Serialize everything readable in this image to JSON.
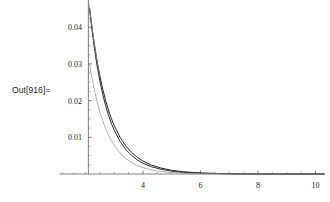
{
  "cell": {
    "out_label": "Out[916]="
  },
  "chart_data": {
    "type": "line",
    "title": "",
    "xlabel": "",
    "ylabel": "",
    "xlim": [
      2.1,
      10.3
    ],
    "ylim": [
      0,
      0.0455
    ],
    "grid": false,
    "legend": null,
    "x_ticks": [
      4,
      6,
      8,
      10
    ],
    "x_tick_labels": [
      "4",
      "6",
      "8",
      "10"
    ],
    "x_minor_ticks": [
      2.5,
      3.0,
      3.5,
      4.5,
      5.0,
      5.5,
      6.5,
      7.0,
      7.5,
      8.5,
      9.0,
      9.5
    ],
    "y_ticks": [
      0.01,
      0.02,
      0.03,
      0.04
    ],
    "y_tick_labels": [
      "0.01",
      "0.02",
      "0.03",
      "0.04"
    ],
    "y_minor_ticks": [
      0.0025,
      0.005,
      0.0075,
      0.0125,
      0.015,
      0.0175,
      0.0225,
      0.025,
      0.0275,
      0.0325,
      0.035,
      0.0375,
      0.0425,
      0.045
    ],
    "axis_origin": {
      "x": 2.1,
      "y": 0
    },
    "series": [
      {
        "name": "curve-1-dark",
        "color": "#222222",
        "width": 1.0,
        "x": [
          2.14,
          2.2,
          2.3,
          2.4,
          2.5,
          2.6,
          2.7,
          2.8,
          2.9,
          3.0,
          3.2,
          3.4,
          3.6,
          3.8,
          4.0,
          4.3,
          4.6,
          5.0,
          5.4,
          5.8,
          6.2,
          6.8,
          7.4,
          8.0,
          8.8,
          9.6,
          10.3
        ],
        "y": [
          0.0452,
          0.0415,
          0.0358,
          0.0309,
          0.0267,
          0.0231,
          0.02,
          0.0174,
          0.0151,
          0.0132,
          0.01,
          0.00765,
          0.00588,
          0.00454,
          0.00352,
          0.00242,
          0.00167,
          0.001,
          0.00061,
          0.00037,
          0.00023,
          0.00011,
          5e-05,
          3e-05,
          1e-05,
          4e-06,
          2e-06
        ]
      },
      {
        "name": "curve-2-dark",
        "color": "#2b2b2b",
        "width": 1.0,
        "x": [
          2.14,
          2.2,
          2.3,
          2.4,
          2.5,
          2.6,
          2.7,
          2.8,
          2.9,
          3.0,
          3.2,
          3.4,
          3.6,
          3.8,
          4.0,
          4.3,
          4.6,
          5.0,
          5.4,
          5.8,
          6.2,
          6.8,
          7.4,
          8.0,
          8.8,
          9.6,
          10.3
        ],
        "y": [
          0.0452,
          0.0409,
          0.0347,
          0.0296,
          0.0253,
          0.0217,
          0.0186,
          0.016,
          0.0138,
          0.0119,
          0.0089,
          0.0067,
          0.00507,
          0.00385,
          0.00294,
          0.00197,
          0.00133,
          0.00077,
          0.00045,
          0.00027,
          0.00016,
          7e-05,
          3e-05,
          1.5e-05,
          5e-06,
          2e-06,
          1e-06
        ]
      },
      {
        "name": "curve-3-light",
        "color": "#9a9a9a",
        "width": 0.8,
        "x": [
          2.14,
          2.2,
          2.3,
          2.4,
          2.5,
          2.6,
          2.7,
          2.8,
          2.9,
          3.0,
          3.2,
          3.4,
          3.6,
          3.8,
          4.0,
          4.3,
          4.6,
          5.0,
          5.4,
          5.8,
          6.2,
          6.8,
          7.4,
          8.0,
          8.8,
          9.6,
          10.3
        ],
        "y": [
          0.03,
          0.0272,
          0.0232,
          0.0198,
          0.0169,
          0.0145,
          0.0124,
          0.0106,
          0.0091,
          0.0078,
          0.00573,
          0.00422,
          0.00312,
          0.00231,
          0.00172,
          0.0011,
          0.00071,
          0.00038,
          0.00021,
          0.00011,
          6e-05,
          2e-05,
          1e-05,
          5e-06,
          2e-06,
          1e-06,
          5e-07
        ]
      },
      {
        "name": "curve-4-upper-left-light",
        "color": "#8f8f8f",
        "width": 0.8,
        "x": [
          2.1,
          2.14,
          2.2,
          2.3,
          2.4,
          2.5
        ],
        "y": [
          0.0475,
          0.0452,
          0.0415,
          0.0358,
          0.0309,
          0.0267
        ]
      }
    ]
  },
  "colors": {
    "axis": "#4a4a4a",
    "text": "#1c1c1c",
    "background": "#ffffff"
  }
}
